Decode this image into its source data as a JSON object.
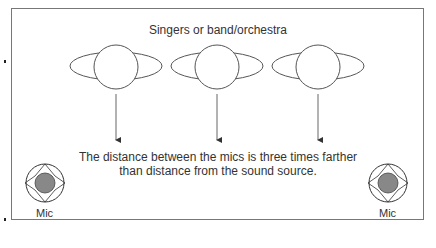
{
  "diagram": {
    "title": "Singers or band/orchestra",
    "caption_line1": "The distance between the mics is three times farther",
    "caption_line2": "than distance from the sound source.",
    "sources": [
      {
        "label": "source-1",
        "cx": 116
      },
      {
        "label": "source-2",
        "cx": 217
      },
      {
        "label": "source-3",
        "cx": 318
      }
    ],
    "mics": [
      {
        "label": "Mic",
        "position": "left"
      },
      {
        "label": "Mic",
        "position": "right"
      }
    ],
    "colors": {
      "line": "#555555",
      "mic_fill": "#888888",
      "frame": "#777777"
    }
  }
}
